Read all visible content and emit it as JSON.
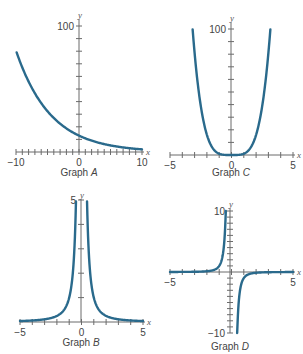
{
  "colors": {
    "curve": "#2a6a8c",
    "axis": "#6b6b6b",
    "text": "#444444"
  },
  "chart_data": [
    {
      "id": "A",
      "type": "line",
      "title": "Graph A",
      "caption_prefix": "Graph ",
      "caption_letter": "A",
      "xlabel": "x",
      "ylabel": "y",
      "xlim": [
        -10,
        10
      ],
      "ylim": [
        0,
        100
      ],
      "x_tick_labels": [
        "-10",
        "0",
        "10"
      ],
      "y_tick_labels": [
        "100"
      ],
      "x_ticks_count": 10,
      "y_ticks_count": 10,
      "function_estimate": "y = 13 * 1.2^(-x)",
      "x": [
        -10,
        -8,
        -6,
        -4,
        -2,
        0,
        2,
        4,
        6,
        8,
        10
      ],
      "values": [
        80,
        56,
        39,
        27,
        19,
        13,
        9,
        6,
        4,
        3,
        2
      ]
    },
    {
      "id": "C",
      "type": "line",
      "title": "Graph C",
      "caption_prefix": "Graph ",
      "caption_letter": "C",
      "xlabel": "x",
      "ylabel": "y",
      "xlim": [
        -5,
        5
      ],
      "ylim": [
        0,
        100
      ],
      "x_tick_labels": [
        "-5",
        "0",
        "5"
      ],
      "y_tick_labels": [
        "100"
      ],
      "function_estimate": "y = x^4",
      "x": [
        -3.16,
        -3,
        -2,
        -1,
        0,
        1,
        2,
        3,
        3.16
      ],
      "values": [
        100,
        81,
        16,
        1,
        0,
        1,
        16,
        81,
        100
      ]
    },
    {
      "id": "B",
      "type": "line",
      "title": "Graph B",
      "caption_prefix": "Graph ",
      "caption_letter": "B",
      "xlabel": "x",
      "ylabel": "y",
      "xlim": [
        -5,
        5
      ],
      "ylim": [
        0,
        5
      ],
      "x_tick_labels": [
        "-5",
        "0",
        "5"
      ],
      "y_tick_labels": [
        "5"
      ],
      "function_estimate": "y = 1/x^2",
      "x": [
        -5,
        -3,
        -2,
        -1,
        -0.45,
        0.45,
        1,
        2,
        3,
        5
      ],
      "values": [
        0.04,
        0.11,
        0.25,
        1,
        5,
        5,
        1,
        0.25,
        0.11,
        0.04
      ]
    },
    {
      "id": "D",
      "type": "line",
      "title": "Graph D",
      "caption_prefix": "Graph ",
      "caption_letter": "D",
      "xlabel": "x",
      "ylabel": "y",
      "xlim": [
        -5,
        5
      ],
      "ylim": [
        -10,
        10
      ],
      "x_tick_labels": [
        "-5",
        "5"
      ],
      "y_tick_labels": [
        "10",
        "-10"
      ],
      "function_estimate": "y = -1/x^3",
      "x": [
        -5,
        -2,
        -1,
        -0.46,
        0.46,
        1,
        2,
        5
      ],
      "values": [
        0.008,
        0.125,
        1,
        10,
        -10,
        -1,
        -0.125,
        -0.008
      ]
    }
  ]
}
